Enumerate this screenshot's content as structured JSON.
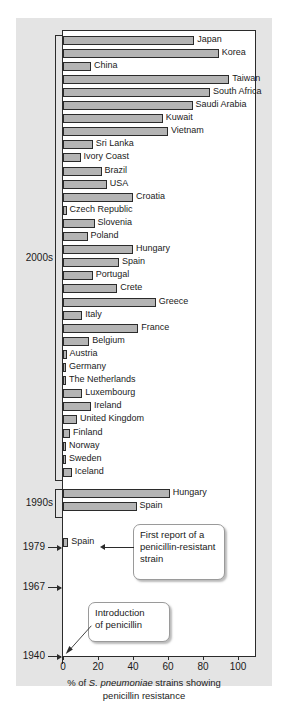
{
  "chart_data": {
    "type": "bar",
    "orientation": "horizontal",
    "title": "",
    "xlabel_line1_prefix": "% of ",
    "xlabel_line1_italic": "S. pneumoniae",
    "xlabel_line1_suffix": " strains showing",
    "xlabel_line2": "penicillin resistance",
    "ylabel": "",
    "xlim": [
      0,
      110
    ],
    "xticks": [
      0,
      20,
      40,
      60,
      80,
      100
    ],
    "xticklabels": [
      "0",
      "20",
      "40",
      "60",
      "80",
      "100"
    ],
    "grid": false,
    "legend": "none",
    "bar_color": "#b4b4b4",
    "bar_edge_color": "#2b2b2b",
    "groups": [
      {
        "label": "2000s",
        "categories": [
          "Japan",
          "Korea",
          "China",
          "Taiwan",
          "South Africa",
          "Saudi Arabia",
          "Kuwait",
          "Vietnam",
          "Sri Lanka",
          "Ivory Coast",
          "Brazil",
          "USA",
          "Croatia",
          "Czech Republic",
          "Slovenia",
          "Poland",
          "Hungary",
          "Spain",
          "Portugal",
          "Crete",
          "Greece",
          "Italy",
          "France",
          "Belgium",
          "Austria",
          "Germany",
          "The Netherlands",
          "Luxembourg",
          "Ireland",
          "United Kingdom",
          "Finland",
          "Norway",
          "Sweden",
          "Iceland"
        ],
        "values": [
          75,
          89,
          16,
          95,
          84,
          74,
          57,
          60,
          17,
          10,
          22,
          25,
          40,
          2,
          18,
          14,
          40,
          32,
          17,
          31,
          53,
          11,
          43,
          15,
          2,
          1,
          1,
          11,
          16,
          8,
          4,
          1,
          1,
          5
        ]
      },
      {
        "label": "1990s",
        "categories": [
          "Hungary",
          "Spain"
        ],
        "values": [
          61,
          42
        ]
      },
      {
        "label": "1979",
        "categories": [
          "Spain"
        ],
        "values": [
          3
        ]
      }
    ],
    "year_markers": [
      "1979",
      "1967",
      "1940"
    ],
    "annotations": [
      {
        "name": "first-report-callout",
        "text": "First report of a penicillin-resistant strain",
        "lines": [
          "First report of a",
          "penicillin-resistant",
          "strain"
        ],
        "points_to": "1979 Spain"
      },
      {
        "name": "introduction-callout",
        "text": "Introduction of penicillin",
        "lines": [
          "Introduction",
          "of penicillin"
        ],
        "points_to": "1940"
      }
    ]
  },
  "colors": {
    "panel_background": "#e4e4e4",
    "plot_background": "#ffffff",
    "axis": "#2b2b2b",
    "bar_fill": "#b4b4b4",
    "callout_border": "#9a9a9a"
  }
}
